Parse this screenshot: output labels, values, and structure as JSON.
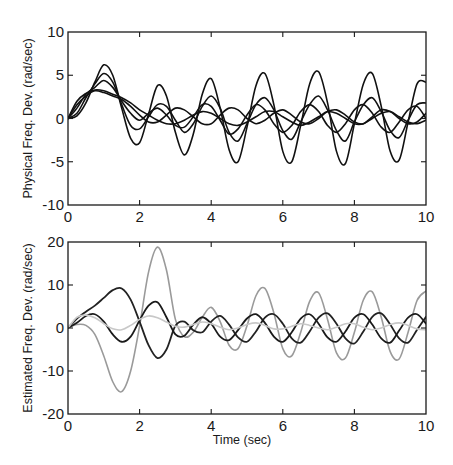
{
  "chart_data": [
    {
      "type": "line",
      "title": "",
      "xlabel": "",
      "ylabel": "Physical Freq. Dev. (rad/sec)",
      "xlim": [
        0,
        10
      ],
      "ylim": [
        -10,
        10
      ],
      "xticks": [
        0,
        2,
        4,
        6,
        8,
        10
      ],
      "yticks": [
        -10,
        -5,
        0,
        5,
        10
      ],
      "xtick_labels": [
        "0",
        "2",
        "4",
        "6",
        "8",
        "10"
      ],
      "ytick_labels": [
        "-10",
        "-5",
        "0",
        "5",
        "10"
      ],
      "grid": false,
      "legend": null,
      "series": [
        {
          "name": "machine-1",
          "color": "#111111",
          "width": 1.6,
          "x": [
            0,
            0.25,
            0.5,
            0.75,
            1.0,
            1.25,
            1.5,
            1.75,
            2.0,
            2.25,
            2.5,
            2.75,
            3.0,
            3.25,
            3.5,
            3.75,
            4.0,
            4.25,
            4.5,
            4.75,
            5.0,
            5.25,
            5.5,
            5.75,
            6.0,
            6.25,
            6.5,
            6.75,
            7.0,
            7.25,
            7.5,
            7.75,
            8.0,
            8.25,
            8.5,
            8.75,
            9.0,
            9.25,
            9.5,
            9.75,
            10.0
          ],
          "values": [
            0,
            0.3,
            1.8,
            4.2,
            6.2,
            5.0,
            1.2,
            -2.3,
            -2.8,
            0.5,
            3.8,
            2.6,
            -1.6,
            -4.2,
            -1.8,
            2.8,
            4.6,
            1.2,
            -3.6,
            -5.0,
            -1.0,
            3.8,
            5.2,
            1.6,
            -3.8,
            -5.0,
            -0.8,
            4.0,
            5.4,
            1.8,
            -3.8,
            -5.2,
            -0.6,
            4.0,
            5.2,
            1.4,
            -3.8,
            -4.8,
            -0.4,
            4.0,
            4.2
          ]
        },
        {
          "name": "machine-2",
          "color": "#111111",
          "width": 1.6,
          "x": [
            0,
            0.25,
            0.5,
            0.75,
            1.0,
            1.25,
            1.5,
            1.75,
            2.0,
            2.25,
            2.5,
            2.75,
            3.0,
            3.25,
            3.5,
            3.75,
            4.0,
            4.25,
            4.5,
            4.75,
            5.0,
            5.25,
            5.5,
            5.75,
            6.0,
            6.25,
            6.5,
            6.75,
            7.0,
            7.25,
            7.5,
            7.75,
            8.0,
            8.25,
            8.5,
            8.75,
            9.0,
            9.25,
            9.5,
            9.75,
            10.0
          ],
          "values": [
            0,
            0.6,
            2.4,
            4.0,
            5.2,
            4.2,
            1.6,
            -0.8,
            -1.2,
            0.2,
            1.6,
            1.4,
            -0.2,
            -1.6,
            -0.6,
            1.4,
            2.6,
            1.2,
            -1.6,
            -2.6,
            -0.6,
            1.6,
            2.4,
            1.0,
            -1.4,
            -2.4,
            -0.4,
            1.6,
            2.6,
            1.0,
            -1.4,
            -2.6,
            -0.4,
            1.6,
            2.4,
            0.8,
            -1.4,
            -2.2,
            -0.2,
            1.6,
            1.8
          ]
        },
        {
          "name": "machine-3",
          "color": "#111111",
          "width": 1.6,
          "x": [
            0,
            0.25,
            0.5,
            0.75,
            1.0,
            1.25,
            1.5,
            1.75,
            2.0,
            2.25,
            2.5,
            2.75,
            3.0,
            3.25,
            3.5,
            3.75,
            4.0,
            4.25,
            4.5,
            4.75,
            5.0,
            5.25,
            5.5,
            5.75,
            6.0,
            6.25,
            6.5,
            6.75,
            7.0,
            7.25,
            7.5,
            7.75,
            8.0,
            8.25,
            8.5,
            8.75,
            9.0,
            9.25,
            9.5,
            9.75,
            10.0
          ],
          "values": [
            0,
            1.2,
            2.8,
            3.6,
            4.4,
            3.6,
            2.0,
            0.6,
            -0.2,
            0.6,
            1.2,
            0.4,
            -0.8,
            -1.0,
            0.2,
            1.6,
            1.4,
            -0.2,
            -1.8,
            -1.2,
            0.4,
            1.6,
            1.0,
            -0.6,
            -1.6,
            -0.8,
            0.8,
            1.6,
            0.8,
            -0.8,
            -1.6,
            -0.6,
            1.0,
            1.6,
            0.6,
            -1.0,
            -1.6,
            -0.4,
            1.0,
            1.4,
            0.0
          ]
        },
        {
          "name": "machine-4",
          "color": "#111111",
          "width": 1.6,
          "x": [
            0,
            0.25,
            0.5,
            0.75,
            1.0,
            1.25,
            1.5,
            1.75,
            2.0,
            2.25,
            2.5,
            2.75,
            3.0,
            3.25,
            3.5,
            3.75,
            4.0,
            4.25,
            4.5,
            4.75,
            5.0,
            5.25,
            5.5,
            5.75,
            6.0,
            6.25,
            6.5,
            6.75,
            7.0,
            7.25,
            7.5,
            7.75,
            8.0,
            8.25,
            8.5,
            8.75,
            9.0,
            9.25,
            9.5,
            9.75,
            10.0
          ],
          "values": [
            0,
            2.0,
            2.9,
            3.3,
            3.2,
            2.8,
            2.4,
            1.8,
            1.0,
            0.4,
            -0.2,
            -0.6,
            -0.6,
            -0.2,
            0.4,
            0.8,
            0.6,
            0.0,
            -0.6,
            -0.8,
            -0.4,
            0.2,
            0.8,
            0.8,
            0.2,
            -0.4,
            -0.8,
            -0.4,
            0.2,
            0.8,
            0.6,
            0.0,
            -0.6,
            -0.6,
            0.0,
            0.6,
            0.8,
            0.2,
            -0.4,
            -0.6,
            -0.2
          ]
        },
        {
          "name": "machine-5",
          "color": "#111111",
          "width": 1.6,
          "x": [
            0,
            0.25,
            0.5,
            0.75,
            1.0,
            1.25,
            1.5,
            1.75,
            2.0,
            2.25,
            2.5,
            2.75,
            3.0,
            3.25,
            3.5,
            3.75,
            4.0,
            4.25,
            4.5,
            4.75,
            5.0,
            5.25,
            5.5,
            5.75,
            6.0,
            6.25,
            6.5,
            6.75,
            7.0,
            7.25,
            7.5,
            7.75,
            8.0,
            8.25,
            8.5,
            8.75,
            9.0,
            9.25,
            9.5,
            9.75,
            10.0
          ],
          "values": [
            0,
            1.6,
            2.6,
            3.2,
            3.0,
            2.6,
            2.2,
            1.4,
            0.4,
            -0.4,
            -0.4,
            0.4,
            1.2,
            1.0,
            0.2,
            -0.6,
            -0.6,
            0.4,
            1.2,
            1.0,
            0.0,
            -0.6,
            -0.2,
            0.6,
            1.0,
            0.4,
            -0.4,
            -0.6,
            0.0,
            0.8,
            1.0,
            0.4,
            -0.4,
            -0.6,
            0.2,
            1.0,
            0.8,
            0.0,
            -0.6,
            -0.4,
            0.6
          ]
        }
      ]
    },
    {
      "type": "line",
      "title": "",
      "xlabel": "Time (sec)",
      "ylabel": "Estimated Freq. Dev. (rad/sec)",
      "xlim": [
        0,
        10
      ],
      "ylim": [
        -20,
        20
      ],
      "xticks": [
        0,
        2,
        4,
        6,
        8,
        10
      ],
      "yticks": [
        -20,
        -10,
        0,
        10,
        20
      ],
      "xtick_labels": [
        "0",
        "2",
        "4",
        "6",
        "8",
        "10"
      ],
      "ytick_labels": [
        "-20",
        "-10",
        "0",
        "10",
        "20"
      ],
      "grid": false,
      "legend": null,
      "series": [
        {
          "name": "estimate-1",
          "color": "#9a9a9a",
          "width": 1.6,
          "x": [
            0,
            0.25,
            0.5,
            0.75,
            1.0,
            1.25,
            1.5,
            1.75,
            2.0,
            2.25,
            2.5,
            2.75,
            3.0,
            3.25,
            3.5,
            3.75,
            4.0,
            4.25,
            4.5,
            4.75,
            5.0,
            5.25,
            5.5,
            5.75,
            6.0,
            6.25,
            6.5,
            6.75,
            7.0,
            7.25,
            7.5,
            7.75,
            8.0,
            8.25,
            8.5,
            8.75,
            9.0,
            9.25,
            9.5,
            9.75,
            10.0
          ],
          "values": [
            0,
            0.8,
            0.6,
            -1.5,
            -6.5,
            -12.5,
            -14.8,
            -10.0,
            0.5,
            13.0,
            18.8,
            13.5,
            2.0,
            -2.0,
            -1.0,
            2.5,
            4.8,
            1.5,
            -4.0,
            -4.8,
            0.5,
            7.5,
            9.2,
            3.5,
            -4.8,
            -6.5,
            -1.0,
            6.2,
            8.2,
            2.0,
            -5.8,
            -7.0,
            -1.0,
            6.5,
            8.4,
            2.5,
            -5.5,
            -7.2,
            -1.0,
            6.4,
            8.6
          ]
        },
        {
          "name": "estimate-2",
          "color": "#222222",
          "width": 1.8,
          "x": [
            0,
            0.25,
            0.5,
            0.75,
            1.0,
            1.25,
            1.5,
            1.75,
            2.0,
            2.25,
            2.5,
            2.75,
            3.0,
            3.25,
            3.5,
            3.75,
            4.0,
            4.25,
            4.5,
            4.75,
            5.0,
            5.25,
            5.5,
            5.75,
            6.0,
            6.25,
            6.5,
            6.75,
            7.0,
            7.25,
            7.5,
            7.75,
            8.0,
            8.25,
            8.5,
            8.75,
            9.0,
            9.25,
            9.5,
            9.75,
            10.0
          ],
          "values": [
            0,
            2.2,
            3.8,
            5.2,
            7.0,
            8.8,
            9.2,
            6.6,
            1.5,
            -4.0,
            -7.0,
            -5.0,
            0.5,
            1.5,
            -0.5,
            -1.0,
            1.5,
            2.8,
            0.8,
            -2.2,
            -3.2,
            -0.8,
            2.4,
            3.2,
            1.0,
            -2.4,
            -3.4,
            -0.8,
            2.4,
            3.4,
            1.0,
            -2.4,
            -3.6,
            -0.8,
            2.6,
            3.4,
            0.8,
            -2.4,
            -3.4,
            -0.4,
            2.6
          ]
        },
        {
          "name": "estimate-3",
          "color": "#1a1a1a",
          "width": 1.8,
          "x": [
            0,
            0.25,
            0.5,
            0.75,
            1.0,
            1.25,
            1.5,
            1.75,
            2.0,
            2.25,
            2.5,
            2.75,
            3.0,
            3.25,
            3.5,
            3.75,
            4.0,
            4.25,
            4.5,
            4.75,
            5.0,
            5.25,
            5.5,
            5.75,
            6.0,
            6.25,
            6.5,
            6.75,
            7.0,
            7.25,
            7.5,
            7.75,
            8.0,
            8.25,
            8.5,
            8.75,
            9.0,
            9.25,
            9.5,
            9.75,
            10.0
          ],
          "values": [
            0,
            1.2,
            2.8,
            3.2,
            1.5,
            -1.5,
            -3.2,
            -2.0,
            1.8,
            5.2,
            6.0,
            2.5,
            -1.5,
            -1.8,
            0.8,
            2.5,
            1.0,
            -2.0,
            -2.8,
            -0.5,
            2.2,
            3.2,
            1.2,
            -2.0,
            -3.2,
            -1.0,
            2.2,
            3.2,
            1.0,
            -2.2,
            -3.2,
            -0.8,
            2.4,
            3.2,
            0.8,
            -2.4,
            -3.4,
            -0.6,
            2.4,
            3.2,
            1.0
          ]
        },
        {
          "name": "estimate-4",
          "color": "#c8c8c8",
          "width": 1.6,
          "x": [
            0,
            0.25,
            0.5,
            0.75,
            1.0,
            1.25,
            1.5,
            1.75,
            2.0,
            2.25,
            2.5,
            2.75,
            3.0,
            3.25,
            3.5,
            3.75,
            4.0,
            4.25,
            4.5,
            4.75,
            5.0,
            5.25,
            5.5,
            5.75,
            6.0,
            6.25,
            6.5,
            6.75,
            7.0,
            7.25,
            7.5,
            7.75,
            8.0,
            8.25,
            8.5,
            8.75,
            9.0,
            9.25,
            9.5,
            9.75,
            10.0
          ],
          "values": [
            0,
            2.5,
            3.0,
            2.4,
            1.0,
            -0.2,
            -0.4,
            0.6,
            2.0,
            2.8,
            2.4,
            1.4,
            0.4,
            0.2,
            0.8,
            1.4,
            1.0,
            0.2,
            -0.4,
            0.0,
            0.8,
            1.2,
            0.6,
            -0.2,
            -0.2,
            0.4,
            1.0,
            0.6,
            0.0,
            -0.4,
            0.2,
            1.0,
            1.0,
            0.2,
            -0.4,
            0.0,
            0.8,
            1.2,
            0.6,
            -0.2,
            -0.4
          ]
        }
      ]
    }
  ],
  "layout": {
    "plots": [
      {
        "frame": {
          "x": 68,
          "y": 32,
          "w": 358,
          "h": 173
        }
      },
      {
        "frame": {
          "x": 68,
          "y": 242,
          "w": 358,
          "h": 172
        }
      }
    ]
  }
}
